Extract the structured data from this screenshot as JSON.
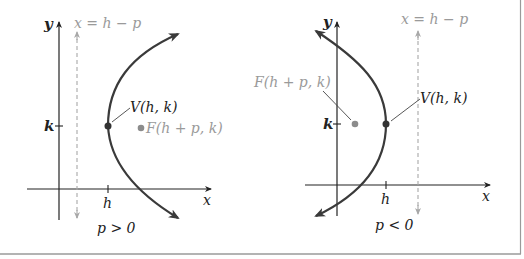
{
  "colors": {
    "axis": "#222222",
    "curve": "#3a3a3a",
    "directrix": "#a8a8a8",
    "vertex": "#333333",
    "focus": "#8c8c8c",
    "label_dark": "#222222",
    "label_light": "#9a9a9a",
    "frame": "#9a9a9a"
  },
  "panels": [
    {
      "id": "left",
      "caption": "p > 0",
      "y_axis_label": "y",
      "x_axis_label": "x",
      "tick_h_label": "h",
      "tick_k_label": "k",
      "directrix_label": "x = h − p",
      "vertex_label": "V(h, k)",
      "focus_label": "F(h + p, k)",
      "opens": "right"
    },
    {
      "id": "right",
      "caption": "p < 0",
      "y_axis_label": "y",
      "x_axis_label": "x",
      "tick_h_label": "h",
      "tick_k_label": "k",
      "directrix_label": "x = h − p",
      "vertex_label": "V(h, k)",
      "focus_label": "F(h + p, k)",
      "opens": "left"
    }
  ]
}
